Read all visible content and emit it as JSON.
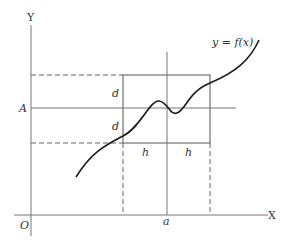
{
  "diagram": {
    "axes": {
      "y_label": "Y",
      "x_label": "X",
      "origin_label": "O"
    },
    "curve_label": "y = f(x)",
    "point_labels": {
      "A": "A",
      "a": "a"
    },
    "box_labels": {
      "d_upper": "d",
      "d_lower": "d",
      "h_left": "h",
      "h_right": "h"
    },
    "colors": {
      "line": "#555555",
      "curve": "#1a1a1a",
      "text": "#333333"
    }
  }
}
